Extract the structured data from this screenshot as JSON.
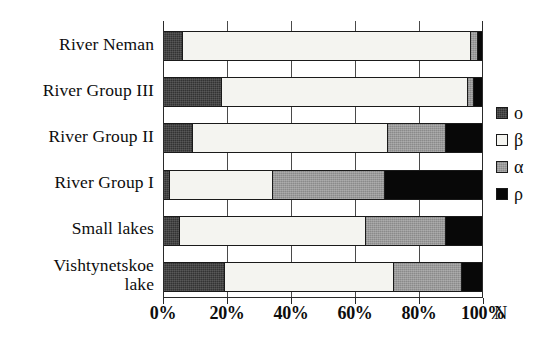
{
  "chart_data": {
    "type": "bar",
    "orientation": "horizontal",
    "stacked": true,
    "normalized": true,
    "title": "",
    "xlabel": "N",
    "ylabel": "",
    "xlim": [
      0,
      100
    ],
    "grid": true,
    "legend_position": "right",
    "x_tick_labels": [
      "0%",
      "20%",
      "40%",
      "60%",
      "80%",
      "100%"
    ],
    "x_tick_values": [
      0,
      20,
      40,
      60,
      80,
      100
    ],
    "categories": [
      "River Neman",
      "River Group III",
      "River Group II",
      "River Group I",
      "Small lakes",
      "Vishtynetskoe\nlake"
    ],
    "series": [
      {
        "name": "o",
        "color": "#333333",
        "values": [
          6,
          18,
          9,
          2,
          5,
          19
        ]
      },
      {
        "name": "β",
        "color": "#f4f4f0",
        "values": [
          90,
          77,
          61,
          32,
          58,
          53
        ]
      },
      {
        "name": "α",
        "color": "#9a9a9a",
        "values": [
          2,
          2,
          18,
          35,
          25,
          21
        ]
      },
      {
        "name": "ρ",
        "color": "#080808",
        "values": [
          2,
          3,
          12,
          31,
          12,
          7
        ]
      }
    ],
    "legend_entries": [
      {
        "label": "o",
        "fill": "o"
      },
      {
        "label": "β",
        "fill": "b"
      },
      {
        "label": "α",
        "fill": "a"
      },
      {
        "label": "ρ",
        "fill": "p"
      }
    ]
  }
}
